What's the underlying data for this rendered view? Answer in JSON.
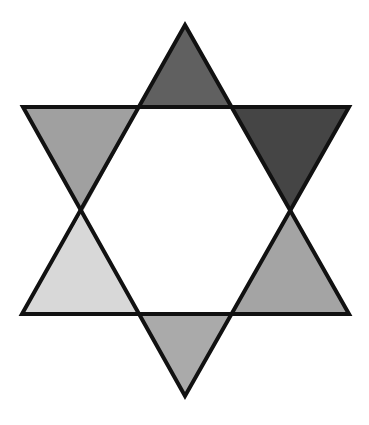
{
  "figure": {
    "canvas": {
      "width": 369,
      "height": 425,
      "background": "#ffffff"
    },
    "stroke": {
      "color": "#111111",
      "width": 4
    },
    "center": {
      "name": "center-hexagon",
      "fill": "#ffffff",
      "points": "140,107 232,107 290,211 232,314 140,314 83,211"
    },
    "points": [
      {
        "name": "top-point",
        "fill": "#606060",
        "points": "185,25 232,107 140,107"
      },
      {
        "name": "top-left-point",
        "fill": "#a0a0a0",
        "points": "23,107 140,107 83,211"
      },
      {
        "name": "top-right-point",
        "fill": "#454545",
        "points": "232,107 349,107 290,211"
      },
      {
        "name": "bottom-left-point",
        "fill": "#d8d8d8",
        "points": "83,211 140,314 22,314"
      },
      {
        "name": "bottom-right-point",
        "fill": "#a4a4a4",
        "points": "290,211 349,314 232,314"
      },
      {
        "name": "bottom-point",
        "fill": "#aaaaaa",
        "points": "140,314 232,314 185,396"
      }
    ],
    "outline": {
      "upward_triangle": "185,25 349,314 22,314",
      "downward_triangle": "23,107 349,107 185,396"
    }
  }
}
